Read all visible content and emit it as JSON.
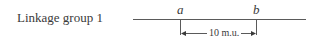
{
  "diagram": {
    "group_label": "Linkage group 1",
    "loci": [
      {
        "name": "a",
        "x": 180
      },
      {
        "name": "b",
        "x": 256
      }
    ],
    "distance_label": "10 m.u.",
    "line_color": "#5a5a5a"
  }
}
